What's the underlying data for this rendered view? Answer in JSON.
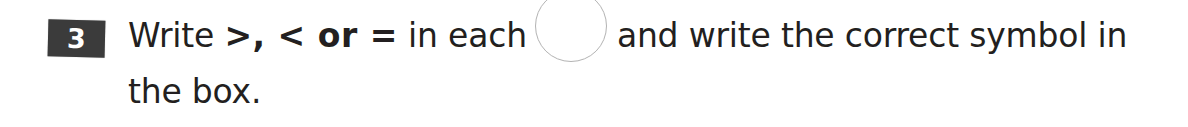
{
  "page": {
    "background_color": "#ffffff",
    "text_color": "#231f20",
    "width": 1188,
    "height": 127
  },
  "question": {
    "number": "3",
    "badge_color": "#3b3b3b",
    "badge_text_color": "#ffffff",
    "line1": {
      "part_a": "Write ",
      "operators": ">, < or =",
      "part_b": " in each",
      "part_c": "and write the correct symbol in"
    },
    "line2": {
      "text": "the box."
    },
    "full_text": "Write >, < or = in each ( ) and write the correct symbol in the box."
  },
  "answer_circle": {
    "name": "answer-circle",
    "stroke_color": "#b3b3b3",
    "fill_color": "#ffffff",
    "diameter_px": 70,
    "value": ""
  }
}
